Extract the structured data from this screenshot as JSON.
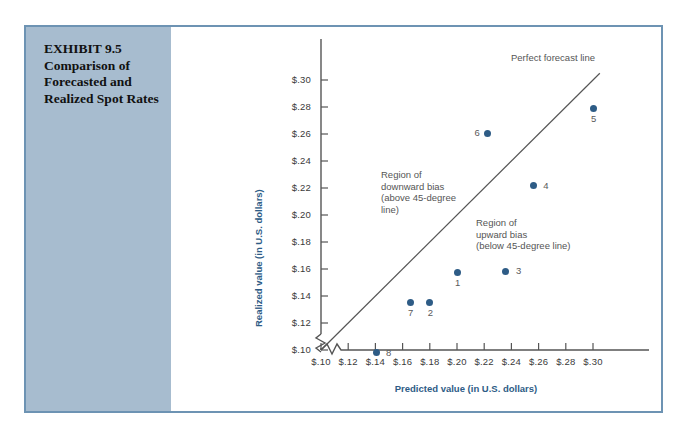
{
  "exhibit": {
    "label": "EXHIBIT 9.5",
    "line2": "Comparison of",
    "line3": "Forecasted and",
    "line4": "Realized Spot Rates",
    "panel_color": "#a7bccf",
    "frame_color": "#6d93b3"
  },
  "chart_data": {
    "type": "scatter",
    "title": "Comparison of Forecasted and Realized Spot Rates",
    "xlabel": "Predicted value (in U.S. dollars)",
    "ylabel": "Realized value (in U.S. dollars)",
    "xlim": [
      0.1,
      0.3
    ],
    "ylim": [
      0.1,
      0.3
    ],
    "xticks": [
      "$.10",
      "$.12",
      "$.14",
      "$.16",
      "$.18",
      "$.20",
      "$.22",
      "$.24",
      "$.26",
      "$.28",
      "$.30"
    ],
    "yticks": [
      "$.10",
      "$.12",
      "$.14",
      "$.16",
      "$.18",
      "$.20",
      "$.22",
      "$.24",
      "$.26",
      "$.28",
      "$.30"
    ],
    "xtick_values": [
      0.1,
      0.12,
      0.14,
      0.16,
      0.18,
      0.2,
      0.22,
      0.24,
      0.26,
      0.28,
      0.3
    ],
    "ytick_values": [
      0.1,
      0.12,
      0.14,
      0.16,
      0.18,
      0.2,
      0.22,
      0.24,
      0.26,
      0.28,
      0.3
    ],
    "grid": false,
    "legend": false,
    "axis_break": true,
    "point_color": "#2e5c86",
    "points": [
      {
        "label": "1",
        "x": 0.2,
        "y": 0.1575,
        "lab_dx": -2,
        "lab_dy": 10
      },
      {
        "label": "2",
        "x": 0.18,
        "y": 0.1355,
        "lab_dx": -2,
        "lab_dy": 10
      },
      {
        "label": "3",
        "x": 0.236,
        "y": 0.1585,
        "lab_dx": 10,
        "lab_dy": -1
      },
      {
        "label": "4",
        "x": 0.256,
        "y": 0.2215,
        "lab_dx": 10,
        "lab_dy": -1
      },
      {
        "label": "5",
        "x": 0.3,
        "y": 0.279,
        "lab_dx": -2,
        "lab_dy": 10
      },
      {
        "label": "6",
        "x": 0.2225,
        "y": 0.2605,
        "lab_dx": -13,
        "lab_dy": -1
      },
      {
        "label": "7",
        "x": 0.1655,
        "y": 0.1355,
        "lab_dx": -2,
        "lab_dy": 10
      },
      {
        "label": "8",
        "x": 0.1405,
        "y": 0.098,
        "lab_dx": 10,
        "lab_dy": -1
      }
    ],
    "reference_line": {
      "name": "Perfect forecast line",
      "slope": 1,
      "intercept": 0,
      "description": "45-degree line"
    },
    "annotations": [
      {
        "name": "downward-bias-region",
        "lines": [
          "Region of",
          "downward bias",
          "(above 45-degree",
          "line)"
        ]
      },
      {
        "name": "upward-bias-region",
        "lines": [
          "Region of",
          "upward bias",
          "(below 45-degree line)"
        ]
      }
    ]
  }
}
